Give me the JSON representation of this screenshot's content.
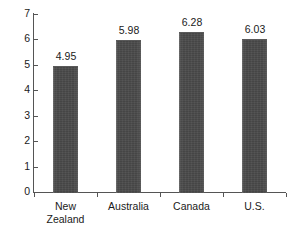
{
  "chart_data": {
    "type": "bar",
    "title": "",
    "subtitle": "",
    "xlabel": "",
    "ylabel": "",
    "categories": [
      "New Zealand",
      "Australia",
      "Canada",
      "U.S."
    ],
    "category_lines": [
      [
        "New",
        "Zealand"
      ],
      [
        "Australia"
      ],
      [
        "Canada"
      ],
      [
        "U.S."
      ]
    ],
    "values": [
      4.95,
      5.98,
      6.28,
      6.03
    ],
    "value_labels": [
      "4.95",
      "5.98",
      "6.28",
      "6.03"
    ],
    "ylim": [
      0,
      7
    ],
    "ytick_labels": [
      "0",
      "1",
      "2",
      "3",
      "4",
      "5",
      "6",
      "7"
    ],
    "ytick_values": [
      0,
      1,
      2,
      3,
      4,
      5,
      6,
      7
    ],
    "grid": false,
    "legend": false,
    "legend_position": "none",
    "bar_color": "#4a4a4a",
    "axis_color": "#555555",
    "background_color": "#ffffff",
    "text_color": "#1a1a1a"
  }
}
